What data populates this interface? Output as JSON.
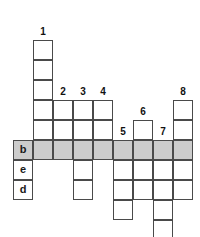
{
  "puzzle": {
    "type": "crossword-grid",
    "cell_size": 20,
    "origin_x": 13,
    "origin_y": 20,
    "columns": 9,
    "rows": 11,
    "colors": {
      "cell_fill": "#ffffff",
      "cell_border": "#4a4a4a",
      "shaded_fill": "#cccccc",
      "text": "#1a1a1a"
    },
    "shaded_row_index": 6,
    "clue_numbers": [
      {
        "label": "1",
        "col": 1,
        "row": 0
      },
      {
        "label": "2",
        "col": 2,
        "row": 3
      },
      {
        "label": "3",
        "col": 3,
        "row": 3
      },
      {
        "label": "4",
        "col": 4,
        "row": 3
      },
      {
        "label": "5",
        "col": 5,
        "row": 5
      },
      {
        "label": "6",
        "col": 6,
        "row": 4
      },
      {
        "label": "7",
        "col": 7,
        "row": 5
      },
      {
        "label": "8",
        "col": 8,
        "row": 3
      }
    ],
    "cells": [
      {
        "col": 0,
        "row": 6,
        "letter": "b",
        "shaded": true
      },
      {
        "col": 0,
        "row": 7,
        "letter": "e",
        "shaded": false
      },
      {
        "col": 0,
        "row": 8,
        "letter": "d",
        "shaded": false
      },
      {
        "col": 1,
        "row": 1,
        "letter": "",
        "shaded": false
      },
      {
        "col": 1,
        "row": 2,
        "letter": "",
        "shaded": false
      },
      {
        "col": 1,
        "row": 3,
        "letter": "",
        "shaded": false
      },
      {
        "col": 1,
        "row": 4,
        "letter": "",
        "shaded": false
      },
      {
        "col": 1,
        "row": 5,
        "letter": "",
        "shaded": false
      },
      {
        "col": 1,
        "row": 6,
        "letter": "",
        "shaded": true
      },
      {
        "col": 2,
        "row": 4,
        "letter": "",
        "shaded": false
      },
      {
        "col": 2,
        "row": 5,
        "letter": "",
        "shaded": false
      },
      {
        "col": 2,
        "row": 6,
        "letter": "",
        "shaded": true
      },
      {
        "col": 3,
        "row": 4,
        "letter": "",
        "shaded": false
      },
      {
        "col": 3,
        "row": 5,
        "letter": "",
        "shaded": false
      },
      {
        "col": 3,
        "row": 6,
        "letter": "",
        "shaded": true
      },
      {
        "col": 3,
        "row": 7,
        "letter": "",
        "shaded": false
      },
      {
        "col": 3,
        "row": 8,
        "letter": "",
        "shaded": false
      },
      {
        "col": 4,
        "row": 4,
        "letter": "",
        "shaded": false
      },
      {
        "col": 4,
        "row": 5,
        "letter": "",
        "shaded": false
      },
      {
        "col": 4,
        "row": 6,
        "letter": "",
        "shaded": true
      },
      {
        "col": 5,
        "row": 6,
        "letter": "",
        "shaded": true
      },
      {
        "col": 5,
        "row": 7,
        "letter": "",
        "shaded": false
      },
      {
        "col": 5,
        "row": 8,
        "letter": "",
        "shaded": false
      },
      {
        "col": 5,
        "row": 9,
        "letter": "",
        "shaded": false
      },
      {
        "col": 6,
        "row": 5,
        "letter": "",
        "shaded": false
      },
      {
        "col": 6,
        "row": 6,
        "letter": "",
        "shaded": true
      },
      {
        "col": 6,
        "row": 7,
        "letter": "",
        "shaded": false
      },
      {
        "col": 6,
        "row": 8,
        "letter": "",
        "shaded": false
      },
      {
        "col": 7,
        "row": 6,
        "letter": "",
        "shaded": true
      },
      {
        "col": 7,
        "row": 7,
        "letter": "",
        "shaded": false
      },
      {
        "col": 7,
        "row": 8,
        "letter": "",
        "shaded": false
      },
      {
        "col": 7,
        "row": 9,
        "letter": "",
        "shaded": false
      },
      {
        "col": 7,
        "row": 10,
        "letter": "",
        "shaded": false
      },
      {
        "col": 8,
        "row": 4,
        "letter": "",
        "shaded": false
      },
      {
        "col": 8,
        "row": 5,
        "letter": "",
        "shaded": false
      },
      {
        "col": 8,
        "row": 6,
        "letter": "",
        "shaded": true
      },
      {
        "col": 8,
        "row": 7,
        "letter": "",
        "shaded": false
      },
      {
        "col": 8,
        "row": 8,
        "letter": "",
        "shaded": false
      }
    ]
  }
}
